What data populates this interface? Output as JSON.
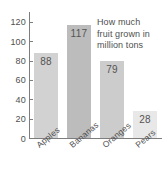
{
  "chart_data": {
    "type": "bar",
    "title": "",
    "categories": [
      "Apples",
      "Bananas",
      "Oranges",
      "Pears"
    ],
    "values": [
      88,
      117,
      79,
      28
    ],
    "value_labels": [
      "88",
      "117",
      "79",
      "28"
    ],
    "xlabel": "",
    "ylabel": "",
    "ylim": [
      0,
      130
    ],
    "yticks": [
      0,
      20,
      40,
      60,
      80,
      100,
      120
    ],
    "ytick_labels": [
      "0",
      "20",
      "40",
      "60",
      "80",
      "100",
      "120"
    ],
    "grid": false,
    "legend": "none",
    "annotation": "How much fruit grown in million tons",
    "annotation_lines": [
      "How much",
      "fruit grown in",
      "million tons"
    ],
    "bar_colors": [
      "#d2d2d2",
      "#bcbcbc",
      "#cccccc",
      "#e8e8e8"
    ],
    "axis_color": "#7d7d7d",
    "text_color": "#4f4f4f",
    "background": "#ffffff"
  }
}
